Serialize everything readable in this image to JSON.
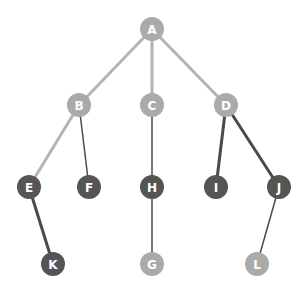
{
  "diagram": {
    "type": "tree",
    "width": 304,
    "height": 289,
    "node_radius": 12,
    "colors": {
      "light_node": "#aaaaaa",
      "dark_node": "#555555",
      "light_edge": "#b4b4b4",
      "dark_edge": "#4a4a4a",
      "label": "#ffffff",
      "background": "#ffffff"
    },
    "nodes": [
      {
        "id": "A",
        "label": "A",
        "x": 152,
        "y": 29,
        "shade": "light"
      },
      {
        "id": "B",
        "label": "B",
        "x": 79,
        "y": 105,
        "shade": "light"
      },
      {
        "id": "C",
        "label": "C",
        "x": 152,
        "y": 105,
        "shade": "light"
      },
      {
        "id": "D",
        "label": "D",
        "x": 226,
        "y": 105,
        "shade": "light"
      },
      {
        "id": "E",
        "label": "E",
        "x": 29,
        "y": 187,
        "shade": "dark"
      },
      {
        "id": "F",
        "label": "F",
        "x": 89,
        "y": 187,
        "shade": "dark"
      },
      {
        "id": "H",
        "label": "H",
        "x": 152,
        "y": 187,
        "shade": "dark"
      },
      {
        "id": "I",
        "label": "I",
        "x": 216,
        "y": 187,
        "shade": "dark"
      },
      {
        "id": "J",
        "label": "J",
        "x": 279,
        "y": 187,
        "shade": "dark"
      },
      {
        "id": "K",
        "label": "K",
        "x": 53,
        "y": 264,
        "shade": "dark"
      },
      {
        "id": "G",
        "label": "G",
        "x": 152,
        "y": 264,
        "shade": "light"
      },
      {
        "id": "L",
        "label": "L",
        "x": 257,
        "y": 264,
        "shade": "light"
      }
    ],
    "edges": [
      {
        "from": "A",
        "to": "B",
        "shade": "light",
        "width": 3
      },
      {
        "from": "A",
        "to": "C",
        "shade": "light",
        "width": 3
      },
      {
        "from": "A",
        "to": "D",
        "shade": "light",
        "width": 3
      },
      {
        "from": "B",
        "to": "E",
        "shade": "light",
        "width": 3
      },
      {
        "from": "B",
        "to": "F",
        "shade": "dark",
        "width": 1.5
      },
      {
        "from": "C",
        "to": "H",
        "shade": "dark",
        "width": 1.5
      },
      {
        "from": "D",
        "to": "I",
        "shade": "dark",
        "width": 3
      },
      {
        "from": "D",
        "to": "J",
        "shade": "dark",
        "width": 3
      },
      {
        "from": "E",
        "to": "K",
        "shade": "dark",
        "width": 3
      },
      {
        "from": "H",
        "to": "G",
        "shade": "dark",
        "width": 1.5
      },
      {
        "from": "J",
        "to": "L",
        "shade": "dark",
        "width": 1.5
      }
    ]
  }
}
